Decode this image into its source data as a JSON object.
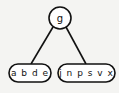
{
  "diagram": {
    "type": "b-tree",
    "root": {
      "label": "g"
    },
    "children": [
      {
        "label": "a b d e"
      },
      {
        "label": "j n p s v x"
      }
    ],
    "colors": {
      "stroke": "#111111",
      "fill": "#ffffff",
      "background": "#f4f4f2"
    }
  }
}
